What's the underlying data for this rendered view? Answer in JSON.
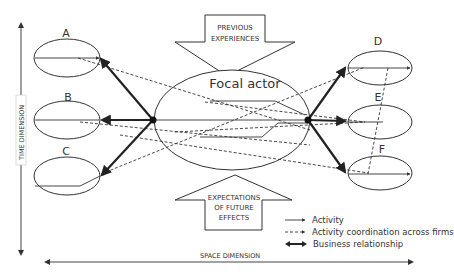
{
  "diagram": {
    "central_node": {
      "label": "Focal actor"
    },
    "nodes": [
      {
        "id": "A",
        "label": "A"
      },
      {
        "id": "B",
        "label": "B"
      },
      {
        "id": "C",
        "label": "C"
      },
      {
        "id": "D",
        "label": "D"
      },
      {
        "id": "E",
        "label": "E"
      },
      {
        "id": "F",
        "label": "F"
      }
    ],
    "top_arrow": {
      "line1": "PREVIOUS",
      "line2": "EXPERIENCES"
    },
    "bottom_arrow": {
      "line1": "EXPECTATIONS",
      "line2": "OF FUTURE",
      "line3": "EFFECTS"
    },
    "axes": {
      "vertical": "TIME DIMENSION",
      "horizontal": "SPACE DIMENSION"
    },
    "legend": [
      {
        "style": "solid",
        "label": "Activity"
      },
      {
        "style": "dashed",
        "label": "Activity coordination across firms"
      },
      {
        "style": "thick-double",
        "label": "Business relationship"
      }
    ],
    "colors": {
      "line": "#333333",
      "background": "#ffffff"
    }
  }
}
